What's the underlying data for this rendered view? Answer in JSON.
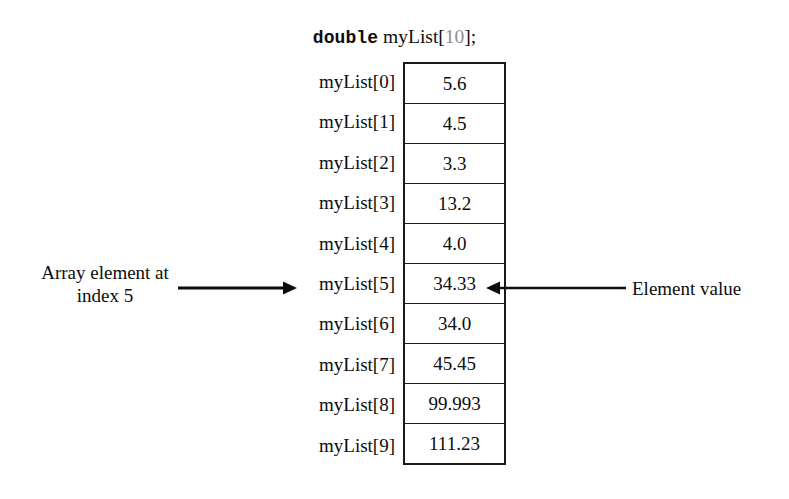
{
  "declaration": {
    "keyword": "double",
    "identifier": " myList",
    "open_bracket": "[",
    "size": "10",
    "close_bracket": "];"
  },
  "array": {
    "labels": [
      "myList[0]",
      "myList[1]",
      "myList[2]",
      "myList[3]",
      "myList[4]",
      "myList[5]",
      "myList[6]",
      "myList[7]",
      "myList[8]",
      "myList[9]"
    ],
    "values": [
      "5.6",
      "4.5",
      "3.3",
      "13.2",
      "4.0",
      "34.33",
      "34.0",
      "45.45",
      "99.993",
      "111.23"
    ]
  },
  "annotations": {
    "left": {
      "line1": "Array element at",
      "line2": "index 5"
    },
    "right": {
      "label": "Element value"
    }
  },
  "colors": {
    "background": "#ffffff",
    "ink": "#0d0d0d",
    "border": "#1a1a1a",
    "size_gray": "#8d8d8d"
  }
}
